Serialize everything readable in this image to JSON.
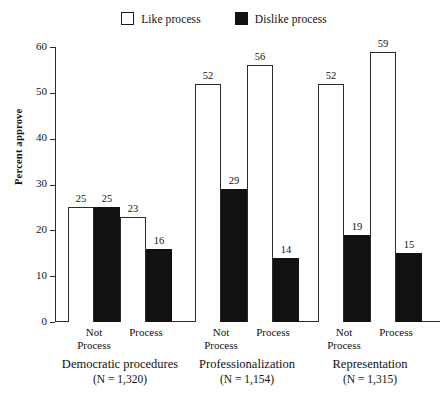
{
  "chart_data": {
    "type": "bar",
    "title": "",
    "xlabel": "",
    "ylabel": "Percent approve",
    "ylim": [
      0,
      60
    ],
    "yticks": [
      0,
      10,
      20,
      30,
      40,
      50,
      60
    ],
    "grid": false,
    "legend_position": "top-center",
    "series": [
      {
        "name": "Like process",
        "style": "open",
        "color": "#ffffff",
        "values": [
          25,
          23,
          52,
          56,
          52,
          59
        ]
      },
      {
        "name": "Dislike process",
        "style": "filled",
        "color": "#111111",
        "values": [
          25,
          16,
          29,
          14,
          19,
          15
        ]
      }
    ],
    "categories": [
      "Not Process",
      "Process",
      "Not Process",
      "Process",
      "Not Process",
      "Process"
    ],
    "groups": [
      {
        "label": "Democratic procedures",
        "n": "(N = 1,320)",
        "categories": [
          {
            "label": "Not\nProcess",
            "like": 25,
            "dislike": 25
          },
          {
            "label": "Process",
            "like": 23,
            "dislike": 16
          }
        ]
      },
      {
        "label": "Professionalization",
        "n": "(N = 1,154)",
        "categories": [
          {
            "label": "Not\nProcess",
            "like": 52,
            "dislike": 29
          },
          {
            "label": "Process",
            "like": 56,
            "dislike": 14
          }
        ]
      },
      {
        "label": "Representation",
        "n": "(N = 1,315)",
        "categories": [
          {
            "label": "Not\nProcess",
            "like": 52,
            "dislike": 19
          },
          {
            "label": "Process",
            "like": 59,
            "dislike": 15
          }
        ]
      }
    ]
  },
  "legend": {
    "items": [
      {
        "label": "Like process",
        "style": "open"
      },
      {
        "label": "Dislike process",
        "style": "filled"
      }
    ]
  },
  "axis": {
    "y_label": "Percent approve",
    "y_ticks": [
      "60",
      "50",
      "40",
      "30",
      "20",
      "10",
      "0"
    ]
  }
}
